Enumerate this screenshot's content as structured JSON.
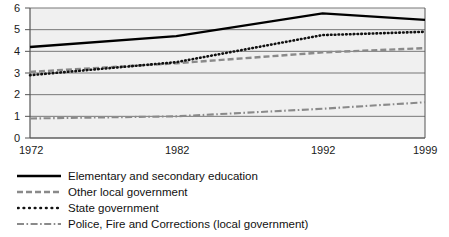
{
  "chart_data": {
    "type": "line",
    "title": "",
    "subtitle": "",
    "xlabel": "",
    "ylabel": "",
    "xlim": [
      1972,
      1999
    ],
    "ylim": [
      0,
      6
    ],
    "grid": true,
    "legend_position": "below",
    "x_ticks": [
      "1972",
      "1982",
      "1992",
      "1999"
    ],
    "x_tick_values": [
      1972,
      1982,
      1992,
      1999
    ],
    "y_ticks": [
      "0",
      "1",
      "2",
      "3",
      "4",
      "5",
      "6"
    ],
    "y_tick_values": [
      0,
      1,
      2,
      3,
      4,
      5,
      6
    ],
    "x": [
      1972,
      1982,
      1992,
      1999
    ],
    "series": [
      {
        "name": "Elementary and secondary education",
        "style": "solid",
        "color": "#000000",
        "values": [
          4.2,
          4.7,
          5.75,
          5.45
        ]
      },
      {
        "name": "Other local government",
        "style": "dashed",
        "color": "#8a8a8a",
        "values": [
          3.05,
          3.45,
          3.95,
          4.15
        ]
      },
      {
        "name": "State government",
        "style": "dotted",
        "color": "#000000",
        "values": [
          2.9,
          3.5,
          4.75,
          4.9
        ]
      },
      {
        "name": "Police, Fire and Corrections (local government)",
        "style": "dashdot",
        "color": "#8a8a8a",
        "values": [
          0.9,
          1.0,
          1.35,
          1.65
        ]
      }
    ]
  },
  "axis": {
    "y_labels": [
      "6",
      "5",
      "4",
      "3",
      "2",
      "1",
      "0"
    ],
    "x_labels": [
      "1972",
      "1982",
      "1992",
      "1999"
    ]
  },
  "legend": {
    "items": [
      {
        "label": "Elementary and secondary education",
        "style": "solid"
      },
      {
        "label": "Other local government",
        "style": "dashed"
      },
      {
        "label": "State government",
        "style": "dotted"
      },
      {
        "label": "Police, Fire and Corrections (local government)",
        "style": "dashdot"
      }
    ]
  },
  "colors": {
    "plot_background": "#f0f0f0",
    "gridline": "#808080",
    "axis": "#555555",
    "solid_series": "#000000",
    "gray_series": "#8a8a8a",
    "text": "#111111"
  }
}
